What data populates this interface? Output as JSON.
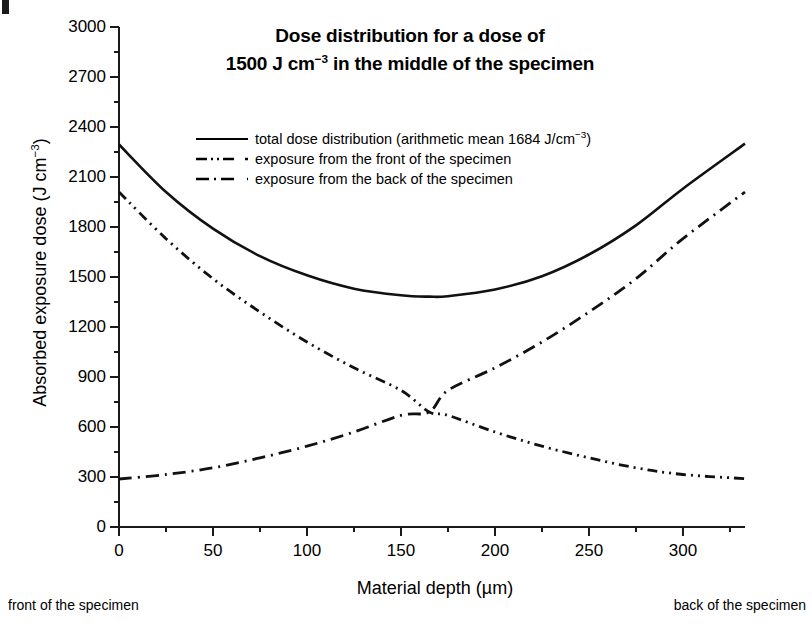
{
  "figure": {
    "title_line1": "Dose distribution for a dose of",
    "title_line2_pre": "1500 J cm",
    "title_line2_sup": "−3",
    "title_line2_post": " in the middle of the specimen",
    "note_front": "front of the specimen",
    "note_back": "back of the specimen",
    "ylabel_pre": "Absorbed exposure dose (J cm",
    "ylabel_sup": "−3",
    "ylabel_post": ")",
    "xlabel": "Material depth (µm)",
    "legend": [
      {
        "style": "solid",
        "label_pre": "total dose distribution (arithmetic mean 1684 J/cm",
        "label_sup": "−3",
        "label_post": ")"
      },
      {
        "style": "dash-dot-dot",
        "label_pre": "exposure from the front of the specimen",
        "label_sup": "",
        "label_post": ""
      },
      {
        "style": "dash-dot",
        "label_pre": "exposure from the back of the specimen",
        "label_sup": "",
        "label_post": ""
      }
    ]
  },
  "chart_data": {
    "type": "line",
    "title": "Dose distribution for a dose of 1500 J cm−3 in the middle of the specimen",
    "xlabel": "Material depth (µm)",
    "ylabel": "Absorbed exposure dose (J cm−3)",
    "xlim": [
      0,
      333
    ],
    "ylim": [
      0,
      3000
    ],
    "yticks": [
      0,
      300,
      600,
      900,
      1200,
      1500,
      1800,
      2100,
      2400,
      2700,
      3000
    ],
    "xticks": [
      0,
      50,
      100,
      150,
      200,
      250,
      300
    ],
    "x_minor_tick_step": 25,
    "y_minor_tick_step": 150,
    "grid": false,
    "legend_position": "upper-center-inside",
    "annotations": {
      "arithmetic_mean": 1684,
      "target_mid_dose": 1500
    },
    "x": [
      0,
      25,
      50,
      75,
      100,
      125,
      150,
      165,
      175,
      200,
      225,
      250,
      275,
      300,
      333
    ],
    "series": [
      {
        "name": "total dose distribution (arithmetic mean 1684 J/cm−3)",
        "style": "solid",
        "values": [
          2295,
          2010,
          1790,
          1625,
          1510,
          1430,
          1390,
          1382,
          1385,
          1425,
          1505,
          1635,
          1810,
          2030,
          2300
        ]
      },
      {
        "name": "exposure from the front of the specimen",
        "style": "dash-dot-dot",
        "values": [
          2010,
          1730,
          1490,
          1290,
          1110,
          955,
          820,
          690,
          670,
          570,
          485,
          415,
          355,
          315,
          290
        ]
      },
      {
        "name": "exposure from the back of the specimen",
        "style": "dash-dot",
        "values": [
          288,
          315,
          355,
          415,
          485,
          570,
          670,
          690,
          820,
          955,
          1110,
          1290,
          1490,
          1730,
          2010
        ]
      }
    ]
  }
}
